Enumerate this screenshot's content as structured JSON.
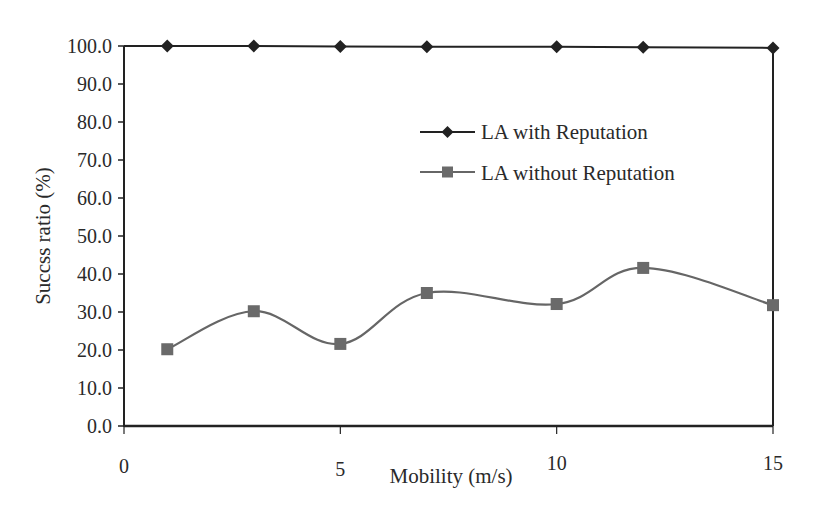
{
  "chart_data": {
    "type": "line",
    "title": "",
    "xlabel": "Mobility (m/s)",
    "ylabel": "Succss ratio (%)",
    "xlim": [
      0,
      15
    ],
    "ylim": [
      0,
      100
    ],
    "x_ticks": [
      "0",
      "5",
      "10",
      "15"
    ],
    "y_ticks": [
      "0.0",
      "10.0",
      "20.0",
      "30.0",
      "40.0",
      "50.0",
      "60.0",
      "70.0",
      "80.0",
      "90.0",
      "100.0"
    ],
    "grid": false,
    "legend_position": "upper right (inside plot)",
    "x": [
      1,
      3,
      5,
      7,
      10,
      12,
      15
    ],
    "series": [
      {
        "name": "LA with Reputation",
        "marker": "diamond",
        "color": "#222222",
        "smooth": false,
        "values": [
          100.0,
          100.0,
          99.9,
          99.8,
          99.8,
          99.7,
          99.5
        ]
      },
      {
        "name": "LA without Reputation",
        "marker": "square",
        "color": "#666666",
        "smooth": true,
        "values": [
          20.2,
          30.2,
          21.6,
          35.0,
          32.1,
          41.6,
          31.8
        ]
      }
    ]
  }
}
